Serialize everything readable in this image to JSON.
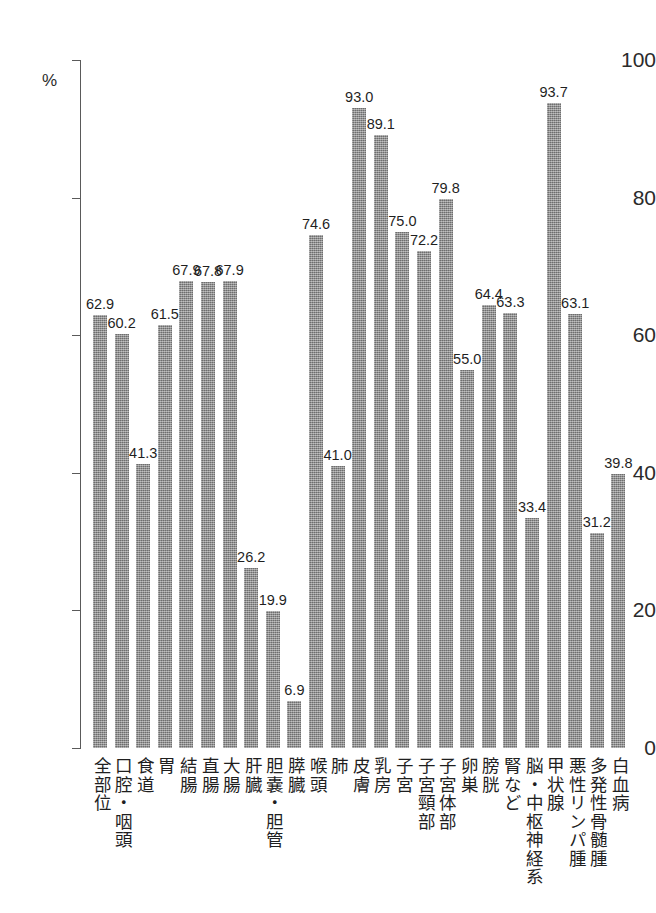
{
  "chart_data": {
    "type": "bar",
    "title": "",
    "subtitle": "",
    "xlabel": "",
    "ylabel": "",
    "y_unit": "%",
    "ylim": [
      0,
      100
    ],
    "yticks": [
      0,
      20,
      40,
      60,
      80,
      100
    ],
    "ytick_labels": [
      "0",
      "20",
      "40",
      "60",
      "80",
      "100"
    ],
    "grid": false,
    "legend": "none",
    "bar_color": "#8b8b8b",
    "axis_color": "#5a5a5a",
    "text_color": "#1f1f1f",
    "categories": [
      "全部位",
      "口腔・咽頭",
      "食道",
      "胃",
      "結腸",
      "直腸",
      "大腸",
      "肝臓",
      "胆嚢・胆管",
      "膵臓",
      "喉頭",
      "肺",
      "皮膚",
      "乳房",
      "子宮",
      "子宮頸部",
      "子宮体部",
      "卵巣",
      "膀胱",
      "腎など",
      "脳・中枢神経系",
      "甲状腺",
      "悪性リンパ腫",
      "多発性骨髄腫",
      "白血病"
    ],
    "values": [
      62.9,
      60.2,
      41.3,
      61.5,
      67.9,
      67.8,
      67.9,
      26.2,
      19.9,
      6.9,
      74.6,
      41.0,
      93.0,
      89.1,
      75.0,
      72.2,
      79.8,
      55.0,
      64.4,
      63.3,
      33.4,
      93.7,
      63.1,
      31.2,
      39.8
    ],
    "value_labels": [
      "62.9",
      "60.2",
      "41.3",
      "61.5",
      "67.9",
      "67.8",
      "67.9",
      "26.2",
      "19.9",
      "6.9",
      "74.6",
      "41.0",
      "93.0",
      "89.1",
      "75.0",
      "72.2",
      "79.8",
      "55.0",
      "64.4",
      "63.3",
      "33.4",
      "93.7",
      "63.1",
      "31.2",
      "39.8"
    ]
  }
}
